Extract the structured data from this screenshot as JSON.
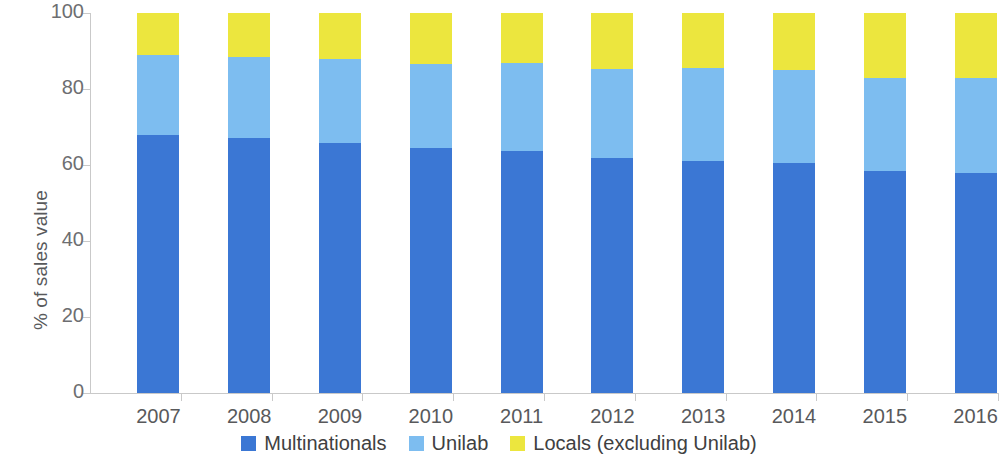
{
  "chart_data": {
    "type": "bar",
    "subtype": "stacked-bar-100",
    "title": "",
    "xlabel": "",
    "ylabel": "% of sales value",
    "ylim": [
      0,
      100
    ],
    "yticks": [
      0,
      20,
      40,
      60,
      80,
      100
    ],
    "ytick_labels": [
      "0",
      "20",
      "40",
      "60",
      "80",
      "100"
    ],
    "grid": false,
    "legend_position": "bottom",
    "categories": [
      "2007",
      "2008",
      "2009",
      "2010",
      "2011",
      "2012",
      "2013",
      "2014",
      "2015",
      "2016"
    ],
    "series": [
      {
        "name": "Multinationals",
        "color": "#3b77d4",
        "values": [
          67.8,
          67.1,
          65.8,
          64.5,
          63.8,
          61.9,
          61.0,
          60.4,
          58.5,
          57.8
        ]
      },
      {
        "name": "Unilab",
        "color": "#7dbdf0",
        "values": [
          21.2,
          21.3,
          22.0,
          22.0,
          23.0,
          23.4,
          24.5,
          24.6,
          24.5,
          25.2
        ]
      },
      {
        "name": "Locals (excluding Unilab)",
        "color": "#ece63e",
        "values": [
          11.0,
          11.6,
          12.2,
          13.5,
          13.2,
          14.7,
          14.5,
          15.0,
          17.0,
          17.0
        ]
      }
    ],
    "cumulative_tops": {
      "multinationals": [
        67.8,
        67.1,
        65.8,
        64.5,
        63.8,
        61.9,
        61.0,
        60.4,
        58.5,
        57.8
      ],
      "multinationals_plus_unilab": [
        89.0,
        88.4,
        87.8,
        86.5,
        86.8,
        85.3,
        85.5,
        85.0,
        83.0,
        83.0
      ],
      "total": [
        100.0,
        100.0,
        100.0,
        100.0,
        100.0,
        100.0,
        100.0,
        100.0,
        100.0,
        100.0
      ]
    }
  },
  "legend": {
    "items": [
      {
        "label": "Multinationals",
        "color": "#3b77d4"
      },
      {
        "label": "Unilab",
        "color": "#7dbdf0"
      },
      {
        "label": "Locals (excluding Unilab)",
        "color": "#ece63e"
      }
    ]
  }
}
